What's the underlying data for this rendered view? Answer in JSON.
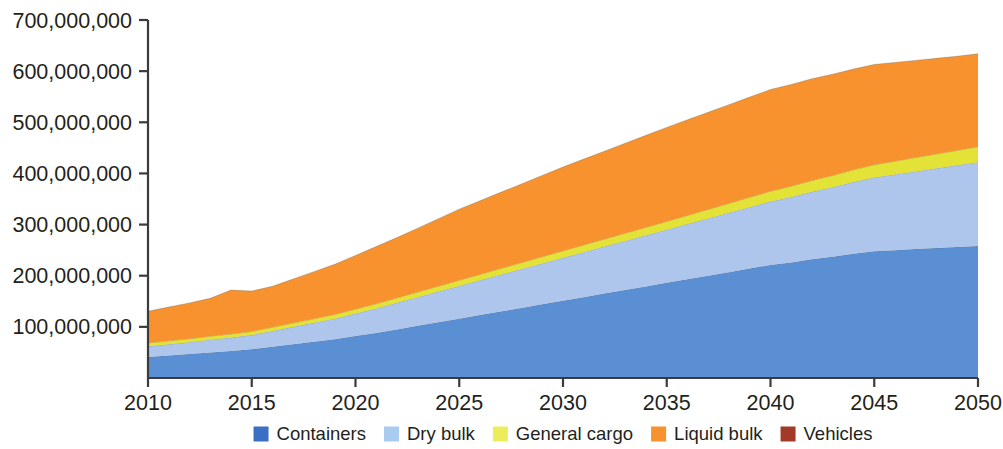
{
  "chart_data": {
    "type": "area",
    "stacked": true,
    "title": "",
    "subtitle": "",
    "xlabel": "",
    "ylabel": "",
    "grid": false,
    "legend_position": "bottom",
    "xlim": [
      2010,
      2050
    ],
    "ylim": [
      0,
      700000000
    ],
    "x_tick_labels": [
      "2010",
      "2015",
      "2020",
      "2025",
      "2030",
      "2035",
      "2040",
      "2045",
      "2050"
    ],
    "x_ticks": [
      2010,
      2015,
      2020,
      2025,
      2030,
      2035,
      2040,
      2045,
      2050
    ],
    "y_tick_labels": [
      "100,000,000",
      "200,000,000",
      "300,000,000",
      "400,000,000",
      "500,000,000",
      "600,000,000",
      "700,000,000"
    ],
    "y_ticks": [
      100000000,
      200000000,
      300000000,
      400000000,
      500000000,
      600000000,
      700000000
    ],
    "x": [
      2010,
      2011,
      2012,
      2013,
      2014,
      2015,
      2016,
      2017,
      2018,
      2019,
      2020,
      2021,
      2022,
      2023,
      2024,
      2025,
      2026,
      2027,
      2028,
      2029,
      2030,
      2031,
      2032,
      2033,
      2034,
      2035,
      2036,
      2037,
      2038,
      2039,
      2040,
      2041,
      2042,
      2043,
      2044,
      2045,
      2046,
      2047,
      2048,
      2049,
      2050
    ],
    "series": [
      {
        "name": "Containers",
        "color": "#5B8FD4",
        "values": [
          41000000,
          44000000,
          47000000,
          50000000,
          53000000,
          56000000,
          61000000,
          66000000,
          71000000,
          76000000,
          82000000,
          88000000,
          95000000,
          102000000,
          109000000,
          116000000,
          123000000,
          130000000,
          137000000,
          144000000,
          151000000,
          158000000,
          165000000,
          172000000,
          179000000,
          186000000,
          193000000,
          200000000,
          207000000,
          214000000,
          221000000,
          226000000,
          232000000,
          237000000,
          243000000,
          248000000,
          250000000,
          252000000,
          254000000,
          256000000,
          258000000
        ]
      },
      {
        "name": "Dry bulk",
        "color": "#AFC6EC",
        "values": [
          21000000,
          22000000,
          23000000,
          25000000,
          26000000,
          28000000,
          31000000,
          34000000,
          37000000,
          40000000,
          44000000,
          48000000,
          52000000,
          56000000,
          60000000,
          64000000,
          68000000,
          72000000,
          76000000,
          80000000,
          84000000,
          88000000,
          92000000,
          96000000,
          100000000,
          104000000,
          108000000,
          112000000,
          116000000,
          120000000,
          124000000,
          128000000,
          132000000,
          136000000,
          140000000,
          144000000,
          148000000,
          152000000,
          156000000,
          160000000,
          164000000
        ]
      },
      {
        "name": "General cargo",
        "color": "#E3E337",
        "values": [
          6500000,
          6600000,
          6700000,
          6800000,
          6900000,
          7000000,
          7300000,
          7600000,
          7900000,
          8200000,
          8600000,
          9000000,
          9500000,
          10000000,
          10500000,
          11000000,
          11500000,
          12000000,
          12500000,
          13000000,
          13500000,
          14000000,
          14500000,
          15000000,
          15500000,
          16000000,
          16800000,
          17600000,
          18400000,
          19200000,
          20000000,
          21000000,
          22000000,
          23000000,
          24000000,
          25000000,
          26000000,
          27000000,
          28000000,
          29000000,
          30000000
        ]
      },
      {
        "name": "Liquid bulk",
        "color": "#F7922E",
        "values": [
          62000000,
          66000000,
          70000000,
          74000000,
          86000000,
          79000000,
          80000000,
          86000000,
          92000000,
          98000000,
          105000000,
          112000000,
          118000000,
          125000000,
          132000000,
          139000000,
          144000000,
          149000000,
          154000000,
          159000000,
          164000000,
          168000000,
          172000000,
          176000000,
          180000000,
          184000000,
          187000000,
          190000000,
          193000000,
          196000000,
          199000000,
          199000000,
          199000000,
          198000000,
          197000000,
          196000000,
          193000000,
          190000000,
          187000000,
          184000000,
          182000000
        ]
      },
      {
        "name": "Vehicles",
        "color": "#A33A28",
        "values": [
          0,
          0,
          0,
          0,
          0,
          0,
          0,
          0,
          0,
          0,
          0,
          0,
          0,
          0,
          0,
          0,
          0,
          0,
          0,
          0,
          0,
          0,
          0,
          0,
          0,
          0,
          0,
          0,
          0,
          0,
          0,
          0,
          0,
          0,
          0,
          0,
          0,
          0,
          0,
          0,
          0
        ]
      }
    ],
    "totals_at_ticks": {
      "2010": 130500000,
      "2015": 170000000,
      "2020": 239600000,
      "2025": 330000000,
      "2030": 412500000,
      "2035": 490000000,
      "2040": 564000000,
      "2045": 613000000,
      "2050": 634000000
    }
  },
  "legend": {
    "items": [
      {
        "label": "Containers",
        "color": "#3B6FC4"
      },
      {
        "label": "Dry bulk",
        "color": "#A9CBF0"
      },
      {
        "label": "General cargo",
        "color": "#EDED5C"
      },
      {
        "label": "Liquid bulk",
        "color": "#F7922E"
      },
      {
        "label": "Vehicles",
        "color": "#A33A28"
      }
    ]
  },
  "axes": {
    "axis_color": "#3b3b3b",
    "label_color": "#231f20"
  }
}
